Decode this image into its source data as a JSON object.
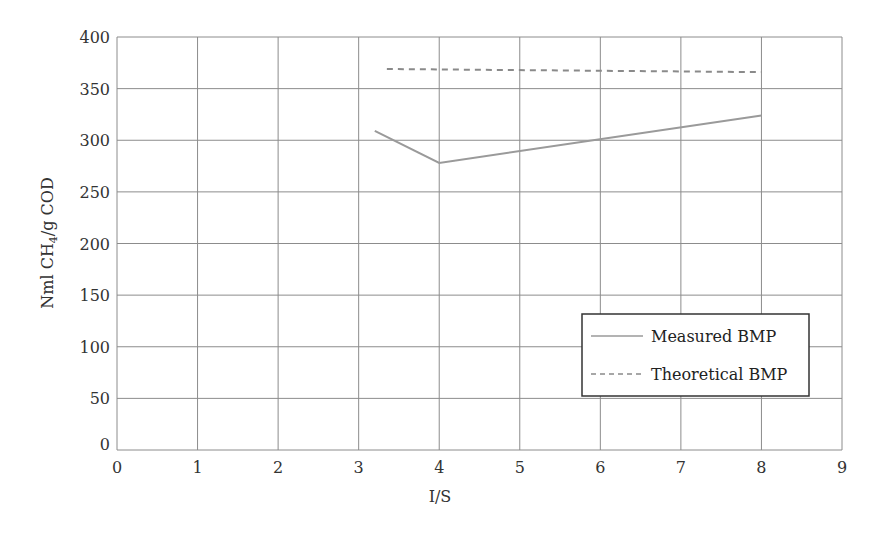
{
  "chart_data": {
    "type": "line",
    "title": "",
    "xlabel": "I/S",
    "ylabel": "Nml CH4/g COD",
    "ylabel_parts": {
      "pre": "Nml CH",
      "sub": "4",
      "post": "/g COD"
    },
    "xlim": [
      0,
      9
    ],
    "ylim": [
      0,
      400
    ],
    "xticks": [
      0,
      1,
      2,
      3,
      4,
      5,
      6,
      7,
      8,
      9
    ],
    "yticks": [
      0,
      50,
      100,
      150,
      200,
      250,
      300,
      350,
      400
    ],
    "grid": true,
    "legend_position": "lower right",
    "series": [
      {
        "name": "Measured BMP",
        "style": "solid",
        "color": "#9a9a9a",
        "x": [
          3.2,
          4,
          8
        ],
        "y": [
          309,
          278,
          324
        ]
      },
      {
        "name": "Theoretical BMP",
        "style": "dashed",
        "color": "#8a8a8a",
        "x": [
          3.35,
          8
        ],
        "y": [
          369,
          366
        ]
      }
    ]
  },
  "legend": {
    "items": [
      {
        "label": "Measured BMP"
      },
      {
        "label": "Theoretical BMP"
      }
    ]
  }
}
